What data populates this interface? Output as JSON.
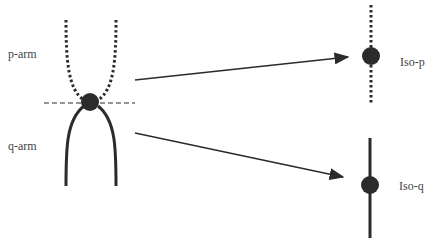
{
  "labels": {
    "p_arm": "p-arm",
    "q_arm": "q-arm",
    "iso_p": "Iso-p",
    "iso_q": "Iso-q"
  },
  "colors": {
    "stroke": "#2b2b2b",
    "text": "#444444",
    "background": "#ffffff"
  }
}
